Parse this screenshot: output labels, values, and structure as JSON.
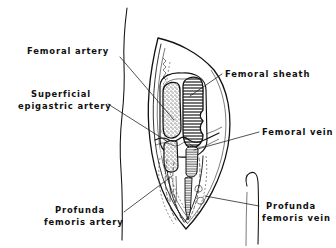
{
  "figure": {
    "background_color": "#ffffff",
    "ink_color": "#111111"
  },
  "labels": [
    {
      "id": "femoral-artery",
      "lines": [
        "Femoral artery"
      ],
      "line1": "Femoral artery",
      "line2": "",
      "align": "left",
      "x": 27,
      "y": 54
    },
    {
      "id": "superficial-epigastric-artery",
      "lines": [
        "Superficial",
        "epigastric artery"
      ],
      "line1": "Superficial",
      "line2": "epigastric artery",
      "align": "left",
      "x": 18,
      "y": 97
    },
    {
      "id": "profunda-femoris-artery",
      "lines": [
        "Profunda",
        "femoris artery"
      ],
      "line1": "Profunda",
      "line2": "femoris artery",
      "align": "left",
      "x": 44,
      "y": 213
    },
    {
      "id": "femoral-sheath",
      "lines": [
        "Femoral sheath"
      ],
      "line1": "Femoral sheath",
      "line2": "",
      "align": "left",
      "x": 225,
      "y": 77
    },
    {
      "id": "femoral-vein",
      "lines": [
        "Femoral vein"
      ],
      "line1": "Femoral vein",
      "line2": "",
      "align": "left",
      "x": 262,
      "y": 135
    },
    {
      "id": "profunda-femoris-vein",
      "lines": [
        "Profunda",
        "femoris vein"
      ],
      "line1": "Profunda",
      "line2": "femoris vein",
      "align": "left",
      "x": 262,
      "y": 209
    }
  ],
  "structures": [
    {
      "id": "femoral-artery-vessel",
      "name": "Femoral artery",
      "texture": "stipple",
      "side": "left"
    },
    {
      "id": "femoral-vein-vessel",
      "name": "Femoral vein",
      "texture": "horizontal-hatch",
      "side": "right"
    },
    {
      "id": "femoral-sheath-outline",
      "name": "Femoral sheath",
      "texture": "outline",
      "side": "enclosing"
    },
    {
      "id": "profunda-femoris-artery-vessel",
      "name": "Profunda femoris artery",
      "texture": "dashed-outline",
      "side": "deep-left"
    },
    {
      "id": "profunda-femoris-vein-vessel",
      "name": "Profunda femoris vein",
      "texture": "dashed-outline",
      "side": "deep-right"
    },
    {
      "id": "superficial-epigastric-artery-vessel",
      "name": "Superficial epigastric artery",
      "texture": "line",
      "side": "transverse-branch"
    },
    {
      "id": "thigh-contour",
      "name": "Thigh skin contour",
      "texture": "line",
      "side": "medial"
    },
    {
      "id": "skin-flap",
      "name": "Reflected skin flap",
      "texture": "outline",
      "side": "lateral"
    }
  ]
}
